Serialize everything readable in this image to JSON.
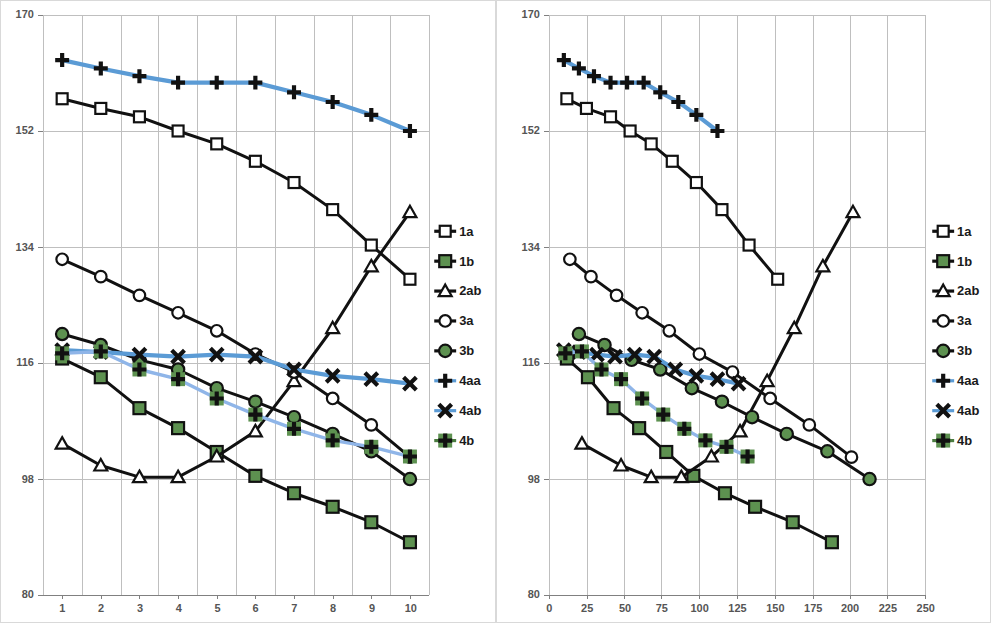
{
  "page": {
    "width": 991,
    "height": 623,
    "background": "#ffffff"
  },
  "colors": {
    "black": "#111111",
    "blue": "#5b9bd5",
    "green": "#4a7c3f",
    "green_fill": "#5d9150",
    "gridline": "#bfbfbf",
    "axis": "#808080",
    "tick_text": "#555555",
    "panel_border": "#d9d9d9"
  },
  "legend": {
    "position": "right",
    "entries": [
      {
        "label": "1a",
        "marker": "square-open",
        "line_color": "#111111",
        "marker_fill": "#ffffff"
      },
      {
        "label": "1b",
        "marker": "square-filled",
        "line_color": "#111111",
        "marker_fill": "#4a7c3f"
      },
      {
        "label": "2ab",
        "marker": "triangle-open",
        "line_color": "#111111",
        "marker_fill": "#ffffff"
      },
      {
        "label": "3a",
        "marker": "circle-open",
        "line_color": "#111111",
        "marker_fill": "#ffffff"
      },
      {
        "label": "3b",
        "marker": "circle-filled",
        "line_color": "#111111",
        "marker_fill": "#4a7c3f"
      },
      {
        "label": "4aa",
        "marker": "plus",
        "line_color": "#5b9bd5",
        "marker_fill": "#111111"
      },
      {
        "label": "4ab",
        "marker": "cross",
        "line_color": "#5b9bd5",
        "marker_fill": "#111111"
      },
      {
        "label": "4b",
        "marker": "plus-boxed",
        "line_color": "#4a7c3f",
        "marker_fill": "#4a7c3f"
      }
    ]
  },
  "chart_data": [
    {
      "id": "left",
      "type": "line",
      "title": "",
      "xlabel": "",
      "ylabel": "",
      "xlim": [
        0.5,
        10.5
      ],
      "ylim": [
        80,
        170
      ],
      "yticks": [
        80,
        98,
        116,
        134,
        152,
        170
      ],
      "xticks": [
        1,
        2,
        3,
        4,
        5,
        6,
        7,
        8,
        9,
        10
      ],
      "x_is_category": true,
      "grid": {
        "vertical": true,
        "horizontal": true
      },
      "legend_position": "right",
      "x": [
        1,
        2,
        3,
        4,
        5,
        6,
        7,
        8,
        9,
        10
      ],
      "series": [
        {
          "name": "1a",
          "marker": "square-open",
          "line_color": "#111111",
          "values": [
            157.0,
            155.5,
            154.2,
            152.0,
            150.0,
            147.3,
            144.0,
            139.8,
            134.3,
            129.0
          ]
        },
        {
          "name": "1b",
          "marker": "square-filled",
          "line_color": "#111111",
          "values": [
            116.7,
            113.8,
            109.0,
            105.9,
            102.2,
            98.5,
            95.8,
            93.7,
            91.3,
            88.2
          ]
        },
        {
          "name": "2ab",
          "marker": "triangle-open",
          "line_color": "#111111",
          "values": [
            103.5,
            100.1,
            98.3,
            98.3,
            101.5,
            105.4,
            113.2,
            121.4,
            131.0,
            139.4
          ]
        },
        {
          "name": "3a",
          "marker": "circle-open",
          "line_color": "#111111",
          "values": [
            132.1,
            129.4,
            126.5,
            123.8,
            121.0,
            117.4,
            114.6,
            110.5,
            106.4,
            101.4
          ]
        },
        {
          "name": "3b",
          "marker": "circle-filled",
          "line_color": "#111111",
          "values": [
            120.5,
            118.8,
            116.5,
            115.0,
            112.1,
            110.0,
            107.6,
            105.0,
            102.3,
            98.0
          ]
        },
        {
          "name": "4aa",
          "marker": "plus",
          "line_color": "#5b9bd5",
          "values": [
            163.0,
            161.7,
            160.5,
            159.5,
            159.5,
            159.5,
            158.0,
            156.5,
            154.5,
            152.0
          ]
        },
        {
          "name": "4ab",
          "marker": "cross",
          "line_color": "#5b9bd5",
          "values": [
            118.0,
            117.7,
            117.3,
            117.0,
            117.3,
            117.0,
            115.0,
            114.0,
            113.5,
            112.8
          ]
        },
        {
          "name": "4b",
          "marker": "plus-boxed",
          "line_color": "#4a7c3f",
          "values": [
            117.5,
            117.8,
            115.0,
            113.5,
            110.5,
            108.0,
            105.8,
            104.0,
            103.0,
            101.5
          ]
        }
      ]
    },
    {
      "id": "right",
      "type": "line",
      "title": "",
      "xlabel": "",
      "ylabel": "",
      "xlim": [
        0,
        250
      ],
      "ylim": [
        80,
        170
      ],
      "yticks": [
        80,
        98,
        116,
        134,
        152,
        170
      ],
      "xticks": [
        0,
        25,
        50,
        75,
        100,
        125,
        150,
        175,
        200,
        225,
        250
      ],
      "x_is_category": false,
      "grid": {
        "vertical": true,
        "horizontal": true
      },
      "legend_position": "right",
      "series": [
        {
          "name": "1a",
          "marker": "square-open",
          "line_color": "#111111",
          "points": [
            [
              12,
              157.0
            ],
            [
              25,
              155.5
            ],
            [
              41,
              154.2
            ],
            [
              54,
              152.0
            ],
            [
              68,
              150.0
            ],
            [
              82,
              147.3
            ],
            [
              98,
              144.0
            ],
            [
              115,
              139.8
            ],
            [
              133,
              134.3
            ],
            [
              152,
              129.0
            ]
          ]
        },
        {
          "name": "1b",
          "marker": "square-filled",
          "line_color": "#111111",
          "points": [
            [
              12,
              116.7
            ],
            [
              26,
              113.8
            ],
            [
              43,
              109.0
            ],
            [
              60,
              105.9
            ],
            [
              78,
              102.2
            ],
            [
              96,
              98.5
            ],
            [
              117,
              95.8
            ],
            [
              137,
              93.7
            ],
            [
              162,
              91.3
            ],
            [
              188,
              88.2
            ]
          ]
        },
        {
          "name": "2ab",
          "marker": "triangle-open",
          "line_color": "#111111",
          "points": [
            [
              22,
              103.5
            ],
            [
              48,
              100.1
            ],
            [
              68,
              98.3
            ],
            [
              88,
              98.3
            ],
            [
              108,
              101.5
            ],
            [
              127,
              105.4
            ],
            [
              145,
              113.2
            ],
            [
              163,
              121.4
            ],
            [
              182,
              131.0
            ],
            [
              202,
              139.4
            ]
          ]
        },
        {
          "name": "3a",
          "marker": "circle-open",
          "line_color": "#111111",
          "points": [
            [
              14,
              132.1
            ],
            [
              28,
              129.4
            ],
            [
              45,
              126.5
            ],
            [
              62,
              123.8
            ],
            [
              80,
              121.0
            ],
            [
              100,
              117.4
            ],
            [
              122,
              114.6
            ],
            [
              147,
              110.5
            ],
            [
              173,
              106.4
            ],
            [
              201,
              101.4
            ]
          ]
        },
        {
          "name": "3b",
          "marker": "circle-filled",
          "line_color": "#111111",
          "points": [
            [
              20,
              120.5
            ],
            [
              37,
              118.8
            ],
            [
              55,
              116.5
            ],
            [
              74,
              115.0
            ],
            [
              95,
              112.1
            ],
            [
              115,
              110.0
            ],
            [
              135,
              107.6
            ],
            [
              158,
              105.0
            ],
            [
              185,
              102.3
            ],
            [
              213,
              98.0
            ]
          ]
        },
        {
          "name": "4aa",
          "marker": "plus",
          "line_color": "#5b9bd5",
          "points": [
            [
              10,
              163.0
            ],
            [
              20,
              161.7
            ],
            [
              30,
              160.5
            ],
            [
              41,
              159.5
            ],
            [
              52,
              159.5
            ],
            [
              63,
              159.5
            ],
            [
              74,
              158.0
            ],
            [
              86,
              156.5
            ],
            [
              98,
              154.5
            ],
            [
              112,
              152.0
            ]
          ]
        },
        {
          "name": "4ab",
          "marker": "cross",
          "line_color": "#5b9bd5",
          "points": [
            [
              10,
              118.0
            ],
            [
              20,
              117.7
            ],
            [
              32,
              117.3
            ],
            [
              44,
              117.0
            ],
            [
              57,
              117.3
            ],
            [
              70,
              117.0
            ],
            [
              84,
              115.0
            ],
            [
              98,
              114.0
            ],
            [
              112,
              113.5
            ],
            [
              126,
              112.8
            ]
          ]
        },
        {
          "name": "4b",
          "marker": "plus-boxed",
          "line_color": "#4a7c3f",
          "points": [
            [
              11,
              117.5
            ],
            [
              22,
              117.8
            ],
            [
              35,
              115.0
            ],
            [
              48,
              113.5
            ],
            [
              62,
              110.5
            ],
            [
              76,
              108.0
            ],
            [
              90,
              105.8
            ],
            [
              104,
              104.0
            ],
            [
              118,
              103.0
            ],
            [
              132,
              101.5
            ]
          ]
        }
      ]
    }
  ]
}
